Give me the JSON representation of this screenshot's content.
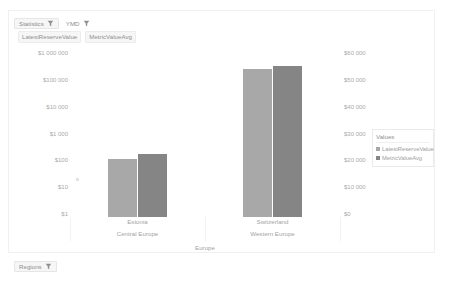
{
  "filter_bar": {
    "items": [
      {
        "label": "Statistics",
        "icon": "filter-funnel-icon"
      },
      {
        "label": "YMD",
        "icon": "filter-funnel-icon"
      }
    ]
  },
  "measure_bar": {
    "items": [
      {
        "label": "LatestReserveValue"
      },
      {
        "label": "MetricValueAvg"
      }
    ]
  },
  "bottom_bar": {
    "items": [
      {
        "label": "Regions",
        "icon": "filter-funnel-icon"
      }
    ]
  },
  "legend": {
    "title": "Values",
    "items": [
      {
        "label": "LatestReserveValue",
        "color": "#a8a8a8"
      },
      {
        "label": "MetricValueAvg",
        "color": "#858585"
      }
    ]
  },
  "chart_data": {
    "type": "bar",
    "title": "",
    "xlabel": "",
    "ylabel": "",
    "grid": false,
    "legend_position": "right",
    "root_category": "Europe",
    "categories": [
      "Estonia",
      "Switzerland"
    ],
    "subcategories": [
      "Central Europe",
      "Western Europe"
    ],
    "left_axis": {
      "scale": "log",
      "label": "",
      "ticks": [
        "$1 000 000",
        "$100 000",
        "$10 000",
        "$1 000",
        "$100",
        "$10",
        "$1"
      ],
      "tick_values": [
        1000000,
        100000,
        10000,
        1000,
        100,
        10,
        1
      ],
      "ylim": [
        1,
        1000000
      ]
    },
    "right_axis": {
      "scale": "linear",
      "label": "",
      "ticks": [
        "$60 000",
        "$50 000",
        "$40 000",
        "$30 000",
        "$20 000",
        "$10 000",
        "$0"
      ],
      "tick_values": [
        60000,
        50000,
        40000,
        30000,
        20000,
        10000,
        0
      ],
      "ylim": [
        0,
        60000
      ]
    },
    "series": [
      {
        "name": "LatestReserveValue",
        "axis": "left",
        "color": "#a8a8a8",
        "values": [
          130,
          52000
        ],
        "bar_fraction": [
          0.345,
          0.885
        ]
      },
      {
        "name": "MetricValueAvg",
        "axis": "right",
        "color": "#858585",
        "values": [
          165,
          54500
        ],
        "bar_fraction": [
          0.375,
          0.905
        ]
      }
    ]
  }
}
